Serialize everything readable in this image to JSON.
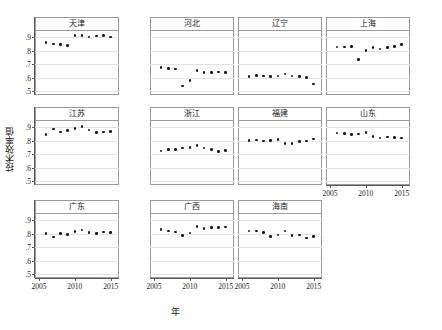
{
  "chart_data": {
    "type": "scatter",
    "title": "",
    "xlabel": "年",
    "ylabel": "技术效率值",
    "xlim": [
      2005,
      2015.6
    ],
    "ylim": [
      0.47,
      0.955
    ],
    "xticks": [
      2005,
      2010,
      2015
    ],
    "xtick_labels": [
      "2005",
      "2010",
      "2015"
    ],
    "yticks": [
      0.5,
      0.6,
      0.7,
      0.8,
      0.9
    ],
    "ytick_labels": [
      ".5",
      ".6",
      ".7",
      ".8",
      ".9"
    ],
    "grid": true,
    "legend": "none",
    "marker": "filled-circle",
    "marker_color": "#1a1a1a",
    "layout": "small-multiples 4x3",
    "x": [
      2006,
      2007,
      2008,
      2009,
      2010,
      2011,
      2012,
      2013,
      2014,
      2015
    ],
    "panels": [
      {
        "name": "天津",
        "row": 0,
        "col": 0,
        "values": [
          0.861,
          0.852,
          0.849,
          0.838,
          0.915,
          0.913,
          0.903,
          0.909,
          0.912,
          0.903
        ]
      },
      {
        "name": "河北",
        "row": 0,
        "col": 1,
        "values": [
          0.673,
          0.669,
          0.665,
          0.536,
          0.578,
          0.654,
          0.636,
          0.637,
          0.643,
          0.638
        ]
      },
      {
        "name": "辽宁",
        "row": 0,
        "col": 2,
        "values": [
          0.609,
          0.616,
          0.613,
          0.607,
          0.611,
          0.626,
          0.611,
          0.606,
          0.601,
          0.553
        ]
      },
      {
        "name": "上海",
        "row": 0,
        "col": 3,
        "values": [
          0.827,
          0.829,
          0.83,
          0.735,
          0.8,
          0.826,
          0.814,
          0.826,
          0.83,
          0.847
        ]
      },
      {
        "name": "江苏",
        "row": 1,
        "col": 0,
        "values": [
          0.847,
          0.889,
          0.864,
          0.875,
          0.892,
          0.908,
          0.88,
          0.862,
          0.865,
          0.87
        ]
      },
      {
        "name": "浙江",
        "row": 1,
        "col": 1,
        "values": [
          0.724,
          0.733,
          0.736,
          0.746,
          0.748,
          0.763,
          0.745,
          0.733,
          0.72,
          0.726
        ]
      },
      {
        "name": "福建",
        "row": 1,
        "col": 2,
        "values": [
          0.8,
          0.806,
          0.799,
          0.803,
          0.81,
          0.78,
          0.779,
          0.796,
          0.799,
          0.813
        ]
      },
      {
        "name": "山东",
        "row": 1,
        "col": 3,
        "values": [
          0.857,
          0.856,
          0.845,
          0.851,
          0.862,
          0.83,
          0.821,
          0.828,
          0.826,
          0.821
        ]
      },
      {
        "name": "广东",
        "row": 2,
        "col": 0,
        "values": [
          0.8,
          0.776,
          0.803,
          0.796,
          0.815,
          0.829,
          0.81,
          0.8,
          0.812,
          0.81
        ]
      },
      {
        "name": "广西",
        "row": 2,
        "col": 1,
        "values": [
          0.834,
          0.82,
          0.812,
          0.788,
          0.805,
          0.854,
          0.838,
          0.848,
          0.847,
          0.85
        ]
      },
      {
        "name": "海南",
        "row": 2,
        "col": 2,
        "values": [
          0.822,
          0.82,
          0.808,
          0.778,
          0.79,
          0.82,
          0.786,
          0.792,
          0.767,
          0.781
        ]
      }
    ]
  }
}
